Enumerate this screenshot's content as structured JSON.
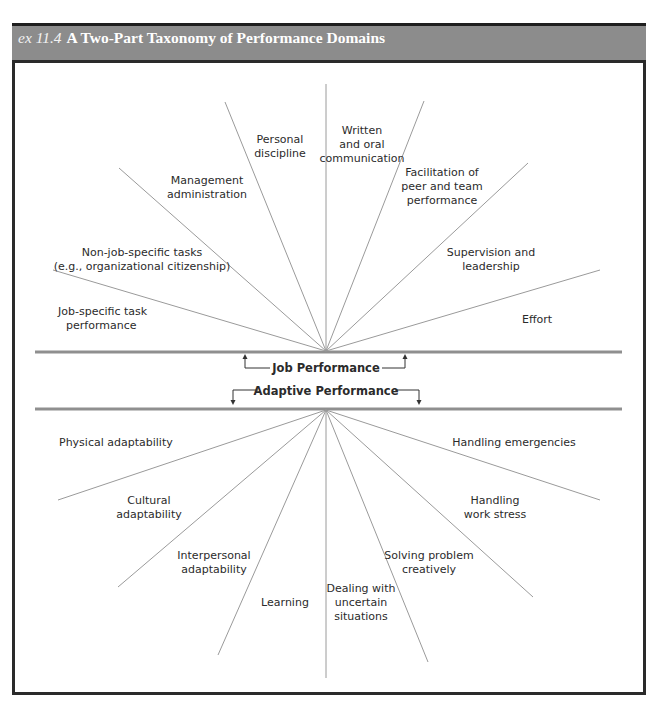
{
  "header": {
    "exhibit_number": "ex 11.4",
    "title": "A Two-Part Taxonomy of Performance Domains",
    "background_color": "#8c8c8c"
  },
  "center": {
    "upper_label": "Job Performance",
    "lower_label": "Adaptive Performance"
  },
  "job_performance_domains": [
    {
      "label": "Personal discipline",
      "lines": [
        "Personal",
        "discipline"
      ]
    },
    {
      "label": "Written and oral communication",
      "lines": [
        "Written",
        "and oral",
        "communication"
      ]
    },
    {
      "label": "Management administration",
      "lines": [
        "Management",
        "administration"
      ]
    },
    {
      "label": "Facilitation of peer and team performance",
      "lines": [
        "Facilitation of",
        "peer and team",
        "performance"
      ]
    },
    {
      "label": "Non-job-specific tasks (e.g., organizational citizenship)",
      "lines": [
        "Non-job-specific tasks",
        "(e.g., organizational citizenship)"
      ]
    },
    {
      "label": "Supervision and leadership",
      "lines": [
        "Supervision and",
        "leadership"
      ]
    },
    {
      "label": "Job-specific task performance",
      "lines": [
        "Job-specific task",
        "performance"
      ]
    },
    {
      "label": "Effort",
      "lines": [
        "Effort"
      ]
    }
  ],
  "adaptive_performance_domains": [
    {
      "label": "Physical adaptability",
      "lines": [
        "Physical adaptability"
      ]
    },
    {
      "label": "Handling emergencies",
      "lines": [
        "Handling emergencies"
      ]
    },
    {
      "label": "Cultural adaptability",
      "lines": [
        "Cultural",
        "adaptability"
      ]
    },
    {
      "label": "Handling work stress",
      "lines": [
        "Handling",
        "work stress"
      ]
    },
    {
      "label": "Interpersonal adaptability",
      "lines": [
        "Interpersonal",
        "adaptability"
      ]
    },
    {
      "label": "Solving problem creatively",
      "lines": [
        "Solving problem",
        "creatively"
      ]
    },
    {
      "label": "Learning",
      "lines": [
        "Learning"
      ]
    },
    {
      "label": "Dealing with uncertain situations",
      "lines": [
        "Dealing with",
        "uncertain",
        "situations"
      ]
    }
  ]
}
